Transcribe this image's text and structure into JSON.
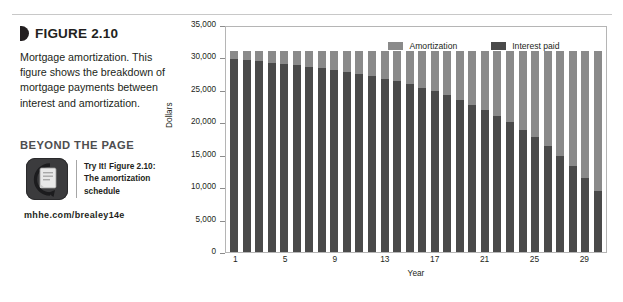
{
  "figure": {
    "label": "FIGURE 2.10",
    "description": "Mortgage amortization. This figure shows the breakdown of mortgage payments between interest and amortization."
  },
  "beyond_the_page": {
    "heading": "BEYOND THE PAGE",
    "icon_name": "document-arrow-icon",
    "text": "Try It! Figure 2.10: The amortization schedule",
    "url": "mhhe.com/brealey14e"
  },
  "chart_data": {
    "type": "bar",
    "stacked": true,
    "title": "",
    "xlabel": "Year",
    "ylabel": "Dollars",
    "ylim": [
      0,
      35000
    ],
    "yticks": [
      0,
      5000,
      10000,
      15000,
      20000,
      25000,
      30000,
      35000
    ],
    "ytick_labels": [
      "0",
      "5,000",
      "10,000",
      "15,000",
      "20,000",
      "25,000",
      "30,000",
      "35,000"
    ],
    "grid": false,
    "legend_position": "top-center",
    "xtick_labels": [
      "1",
      "5",
      "9",
      "13",
      "17",
      "21",
      "25",
      "29"
    ],
    "xticks": [
      1,
      5,
      9,
      13,
      17,
      21,
      25,
      29
    ],
    "categories": [
      1,
      2,
      3,
      4,
      5,
      6,
      7,
      8,
      9,
      10,
      11,
      12,
      13,
      14,
      15,
      16,
      17,
      18,
      19,
      20,
      21,
      22,
      23,
      24,
      25,
      26,
      27,
      28,
      29,
      30
    ],
    "series": [
      {
        "name": "Interest paid",
        "color": "#4a4a4a",
        "values": [
          29700,
          29550,
          29390,
          29210,
          29020,
          28810,
          28590,
          28340,
          28080,
          27790,
          27470,
          27120,
          26740,
          26320,
          25860,
          25350,
          24790,
          24170,
          23490,
          22740,
          21910,
          21000,
          19990,
          18880,
          17660,
          16310,
          14830,
          13190,
          11390,
          9400
        ]
      },
      {
        "name": "Amortization",
        "color": "#8a8a8a",
        "values": [
          1300,
          1450,
          1610,
          1790,
          1980,
          2190,
          2410,
          2660,
          2920,
          3210,
          3530,
          3880,
          4260,
          4680,
          5140,
          5650,
          6210,
          6830,
          7510,
          8260,
          9090,
          10000,
          11010,
          12120,
          13340,
          14690,
          16170,
          17810,
          19610,
          21600
        ]
      }
    ],
    "total_per_bar": 31000
  }
}
